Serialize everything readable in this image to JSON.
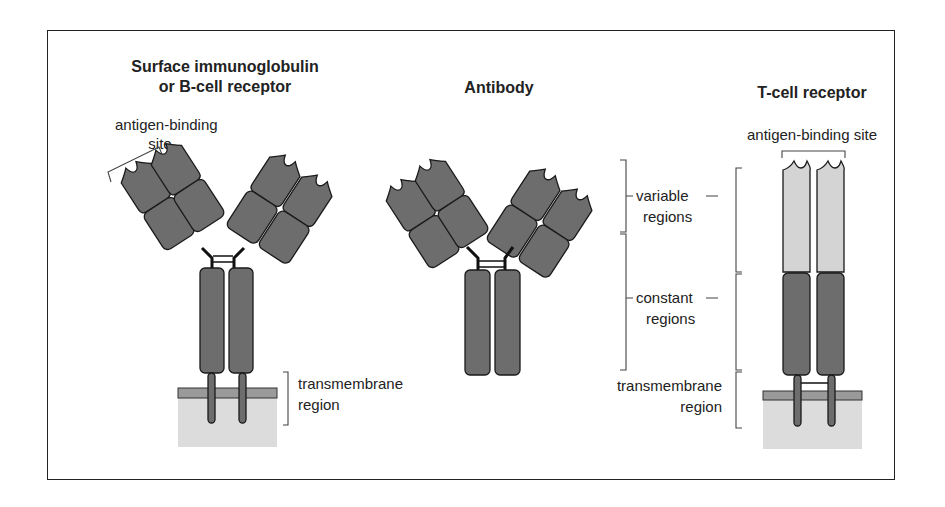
{
  "figure": {
    "panels": [
      {
        "title_line1": "Surface immunoglobulin",
        "title_line2": "or B-cell receptor",
        "label_antigen_1": "antigen-binding",
        "label_antigen_2": "site",
        "label_tm_1": "transmembrane",
        "label_tm_2": "region"
      },
      {
        "title": "Antibody",
        "label_var_1": "variable",
        "label_var_2": "regions",
        "label_const_1": "constant",
        "label_const_2": "regions",
        "label_tm_1": "transmembrane",
        "label_tm_2": "region"
      },
      {
        "title": "T-cell receptor",
        "label_antigen": "antigen-binding site"
      }
    ],
    "colors": {
      "domain": "#6d6d6d",
      "variable_tcr": "#d4d4d4",
      "membrane_band": "#9a9a9a",
      "membrane": "#dcdcdc",
      "outline": "#1a1a1a"
    }
  }
}
